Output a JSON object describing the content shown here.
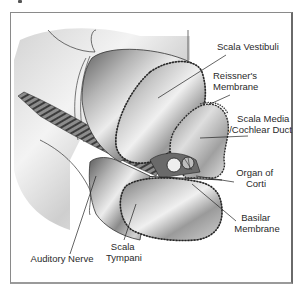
{
  "figure": {
    "title": "",
    "labels": [
      {
        "id": "scala-vestibuli",
        "lines": [
          "Scala Vestibuli"
        ]
      },
      {
        "id": "reissners-membrane",
        "lines": [
          "Reissner's",
          "Membrane"
        ]
      },
      {
        "id": "scala-media",
        "lines": [
          "Scala Media",
          "/Cochlear Duct"
        ]
      },
      {
        "id": "organ-of-corti",
        "lines": [
          "Organ of",
          "Corti"
        ]
      },
      {
        "id": "basilar-membrane",
        "lines": [
          "Basilar",
          "Membrane"
        ]
      },
      {
        "id": "scala-tympani",
        "lines": [
          "Scala",
          "Tympani"
        ]
      },
      {
        "id": "auditory-nerve",
        "lines": [
          "Auditory Nerve"
        ]
      }
    ]
  },
  "colors": {
    "frame": "#8a8a8a",
    "line": "#222222",
    "text": "#2a2a2a",
    "tube_dark": "#6e6e6e",
    "tube_mid": "#a9a9a9",
    "tube_light": "#e6e6e6",
    "background_tissue": "#d9d9d9"
  }
}
